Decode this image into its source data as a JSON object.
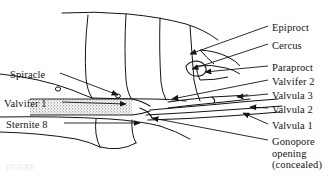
{
  "figure": {
    "background_color": "#ffffff",
    "ink_color": "#141414",
    "caption_text": "FIGURE"
  },
  "labels_right": [
    {
      "id": "epiproct",
      "text": "Epiproct",
      "x": 272,
      "y": 22
    },
    {
      "id": "cercus",
      "text": "Cercus",
      "x": 272,
      "y": 40
    },
    {
      "id": "paraproct",
      "text": "Paraproct",
      "x": 272,
      "y": 62
    },
    {
      "id": "valvifer2",
      "text": "Valvifer 2",
      "x": 272,
      "y": 76
    },
    {
      "id": "valvula3",
      "text": "Valvula 3",
      "x": 272,
      "y": 90
    },
    {
      "id": "valvula2",
      "text": "Valvula 2",
      "x": 272,
      "y": 104
    },
    {
      "id": "valvula1",
      "text": "Valvula 1",
      "x": 272,
      "y": 120
    }
  ],
  "labels_right_multiline": [
    {
      "id": "gonopore",
      "lines": [
        "Gonopore",
        "opening",
        "(concealed)"
      ],
      "x": 272,
      "y": 136
    }
  ],
  "labels_left": [
    {
      "id": "spiracle",
      "text": "Spiracle",
      "x": 10,
      "y": 69
    },
    {
      "id": "valvifer1",
      "text": "Valvifer 1",
      "x": 4,
      "y": 98
    },
    {
      "id": "sternite8",
      "text": "Sternite 8",
      "x": 6,
      "y": 119
    }
  ],
  "leader_lines": [
    {
      "id": "epiproct",
      "from": [
        268,
        26
      ],
      "to": [
        190,
        54
      ],
      "arrow": true
    },
    {
      "id": "cercus",
      "from": [
        268,
        44
      ],
      "to": [
        192,
        69
      ],
      "arrow": true
    },
    {
      "id": "paraproct",
      "from": [
        268,
        66
      ],
      "to": [
        205,
        72
      ],
      "arrow": true
    },
    {
      "id": "valvifer2",
      "from": [
        268,
        80
      ],
      "to": [
        172,
        99
      ],
      "arrow": true
    },
    {
      "id": "valvula3",
      "from": [
        268,
        94
      ],
      "to": [
        237,
        97
      ],
      "arrow": true
    },
    {
      "id": "valvula2",
      "from": [
        268,
        108
      ],
      "to": [
        250,
        107
      ],
      "arrow": true
    },
    {
      "id": "valvula1",
      "from": [
        268,
        124
      ],
      "to": [
        243,
        113
      ],
      "arrow": true
    },
    {
      "id": "gonopore",
      "from": [
        268,
        140
      ],
      "to": [
        152,
        118
      ],
      "arrow": true
    },
    {
      "id": "spiracle",
      "from": [
        60,
        73
      ],
      "to": [
        118,
        95
      ],
      "arrow": true
    },
    {
      "id": "valvifer1",
      "from": [
        62,
        102
      ],
      "to": [
        126,
        104
      ],
      "arrow": true
    },
    {
      "id": "sternite8",
      "from": [
        64,
        123
      ],
      "to": [
        140,
        123
      ],
      "arrow": true
    }
  ],
  "chart_data": {
    "type": "diagram",
    "structures": [
      "Epiproct",
      "Cercus",
      "Paraproct",
      "Valvifer 2",
      "Valvula 3",
      "Valvula 2",
      "Valvula 1",
      "Gonopore opening (concealed)",
      "Spiracle",
      "Valvifer 1",
      "Sternite 8"
    ]
  }
}
